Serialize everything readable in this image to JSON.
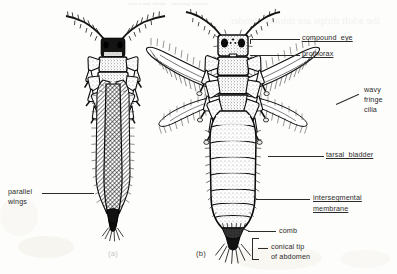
{
  "figure": {
    "title_bleed": "reverse-side print bleed-through, illegible",
    "background_color": "#fdfdfb",
    "ink_color": "#1a1a1a"
  },
  "panels": [
    {
      "id": "a",
      "caption": "(a)",
      "description": "adult thrips with wings folded parallel over abdomen"
    },
    {
      "id": "b",
      "caption": "(b)",
      "description": "adult thrips with wings spread, structures labelled"
    }
  ],
  "labels_left": [
    {
      "name": "parallel-wings",
      "line1": "parallel",
      "line2": "wings",
      "underlined": false
    }
  ],
  "labels_right": [
    {
      "name": "compound-eye",
      "text": "compound  eye",
      "underlined": true
    },
    {
      "name": "prothorax",
      "text": "prothorax",
      "underlined": true
    },
    {
      "name": "wavy-fringe-cilia",
      "line1": "wavy",
      "line2": "fringe",
      "line3": "cilia",
      "underlined": false
    },
    {
      "name": "tarsal-bladder",
      "text": "tarsal  bladder",
      "underlined": true
    },
    {
      "name": "intersegmental-membrane",
      "line1": "intersegmental",
      "line2": "membrane",
      "underlined": true
    },
    {
      "name": "comb",
      "text": "comb",
      "underlined": false
    },
    {
      "name": "conical-tip-of-abdomen",
      "line1": "conical tip",
      "line2": "of abdomen",
      "underlined": false
    }
  ]
}
